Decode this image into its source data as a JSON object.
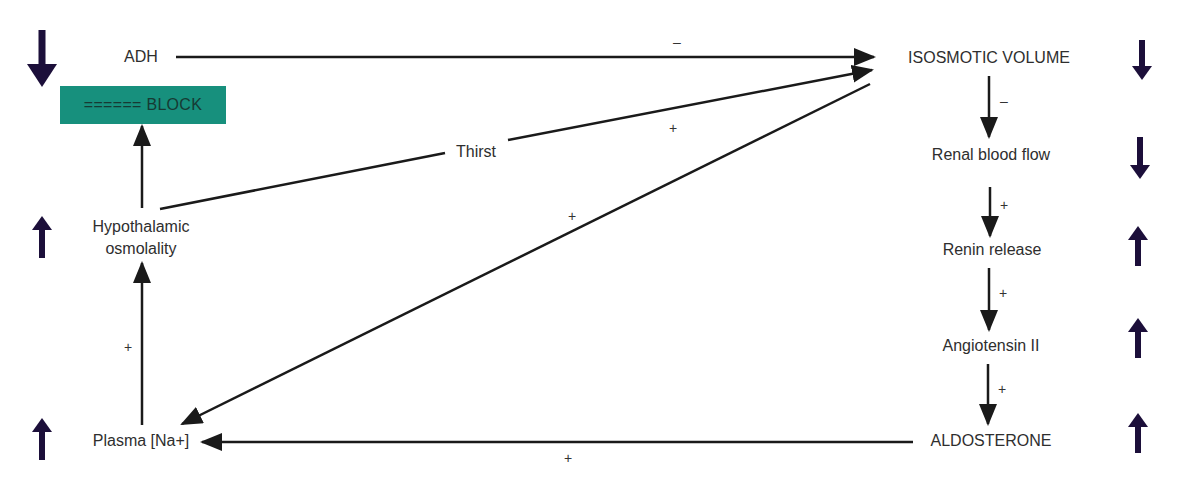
{
  "colors": {
    "indicator": "#1c0f3a",
    "block_fill": "#17907d",
    "edge": "#1a1a1a"
  },
  "nodes": {
    "adh": "ADH",
    "block": "====== BLOCK",
    "hypothalamic": "Hypothalamic\nosmolality",
    "plasma_na": "Plasma [Na+]",
    "isosmotic_volume": "ISOSMOTIC VOLUME",
    "renal_blood_flow": "Renal blood flow",
    "renin_release": "Renin release",
    "angiotensin": "Angiotensin II",
    "aldosterone": "ALDOSTERONE",
    "thirst": "Thirst"
  },
  "edges": [
    {
      "from": "ADH",
      "to": "ISOSMOTIC VOLUME",
      "sign": "–"
    },
    {
      "from": "Hypothalamic osmolality",
      "to": "ISOSMOTIC VOLUME",
      "via": "Thirst",
      "sign": "+"
    },
    {
      "from": "ISOSMOTIC VOLUME",
      "to": "Plasma [Na+]",
      "sign": "+"
    },
    {
      "from": "Hypothalamic osmolality",
      "to": "BLOCK",
      "sign": ""
    },
    {
      "from": "Plasma [Na+]",
      "to": "Hypothalamic osmolality",
      "sign": "+"
    },
    {
      "from": "ISOSMOTIC VOLUME",
      "to": "Renal blood flow",
      "sign": "–"
    },
    {
      "from": "Renal blood flow",
      "to": "Renin release",
      "sign": "+"
    },
    {
      "from": "Renin release",
      "to": "Angiotensin II",
      "sign": "+"
    },
    {
      "from": "Angiotensin II",
      "to": "ALDOSTERONE",
      "sign": "+"
    },
    {
      "from": "ALDOSTERONE",
      "to": "Plasma [Na+]",
      "sign": "+"
    }
  ],
  "signs": {
    "adh_volume": "–",
    "thirst_volume": "+",
    "volume_plasma": "+",
    "plasma_hypo": "+",
    "volume_renal": "–",
    "renal_renin": "+",
    "renin_angio": "+",
    "angio_aldo": "+",
    "aldo_plasma": "+"
  },
  "indicators": {
    "adh": "down",
    "hypothalamic": "up",
    "plasma_na": "up",
    "isosmotic_volume": "down",
    "renal_blood_flow": "down",
    "renin_release": "up",
    "angiotensin": "up",
    "aldosterone": "up"
  }
}
